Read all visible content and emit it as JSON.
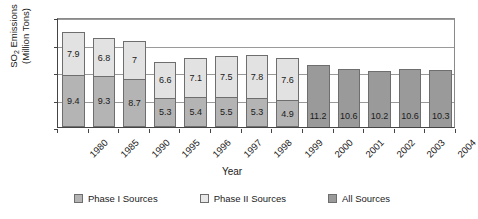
{
  "chart_data": {
    "type": "bar",
    "subtype": "stacked-bar",
    "title": "",
    "xlabel": "Year",
    "ylabel": "SO2 Emissions (Million Tons)",
    "ylabel_line1": "SO",
    "ylabel_sub": "2",
    "ylabel_line1_rest": " Emissions",
    "ylabel_line2": "(Million Tons)",
    "ylim": [
      0,
      20
    ],
    "yticks": [
      0,
      5,
      10,
      15,
      20
    ],
    "ytick_labels": [
      "0",
      "5",
      "10",
      "15",
      "20"
    ],
    "grid": true,
    "legend_position": "bottom",
    "categories": [
      "1980",
      "1985",
      "1990",
      "1995",
      "1996",
      "1997",
      "1998",
      "1999",
      "2000",
      "2001",
      "2002",
      "2003",
      "2004"
    ],
    "series": [
      {
        "name": "Phase I Sources",
        "color": "#b4b4b4",
        "values": [
          9.4,
          9.3,
          8.7,
          5.3,
          5.4,
          5.5,
          5.3,
          4.9,
          null,
          null,
          null,
          null,
          null
        ],
        "labels": [
          "9.4",
          "9.3",
          "8.7",
          "5.3",
          "5.4",
          "5.5",
          "5.3",
          "4.9",
          "",
          "",
          "",
          "",
          ""
        ]
      },
      {
        "name": "Phase II Sources",
        "color": "#e2e2e2",
        "values": [
          7.9,
          6.8,
          7.0,
          6.6,
          7.1,
          7.5,
          7.8,
          7.6,
          null,
          null,
          null,
          null,
          null
        ],
        "labels": [
          "7.9",
          "6.8",
          "7",
          "6.6",
          "7.1",
          "7.5",
          "7.8",
          "7.6",
          "",
          "",
          "",
          "",
          ""
        ]
      },
      {
        "name": "All Sources",
        "color": "#9a9a9a",
        "values": [
          null,
          null,
          null,
          null,
          null,
          null,
          null,
          null,
          11.2,
          10.6,
          10.2,
          10.6,
          10.3
        ],
        "labels": [
          "",
          "",
          "",
          "",
          "",
          "",
          "",
          "",
          "11.2",
          "10.6",
          "10.2",
          "10.6",
          "10.3"
        ]
      }
    ],
    "totals": [
      17.3,
      16.1,
      15.7,
      11.9,
      12.5,
      13.0,
      13.1,
      12.5,
      11.2,
      10.6,
      10.2,
      10.6,
      10.3
    ]
  },
  "legend": {
    "items": [
      {
        "label": "Phase I Sources",
        "swatch": "phase1"
      },
      {
        "label": "Phase II Sources",
        "swatch": "phase2"
      },
      {
        "label": "All Sources",
        "swatch": "all"
      }
    ]
  }
}
